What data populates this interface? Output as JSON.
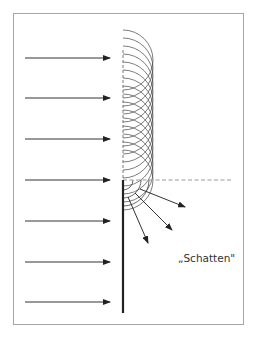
{
  "diagram": {
    "shadow_label": "„Schatten\"",
    "colors": {
      "frame": "#a6a6a6",
      "arrow": "#333333",
      "wall": "#222222",
      "wavelet": "#444444",
      "dashed": "#999999"
    },
    "incident_arrows_y": [
      58,
      98,
      139,
      180,
      221,
      262,
      302
    ],
    "incident_arrow_x_start": 25,
    "incident_arrow_x_end": 110,
    "wall": {
      "x": 123,
      "y_top": 180,
      "y_bottom": 313
    },
    "wavefront_line": {
      "x": 123,
      "y_top": 50,
      "y_bottom": 180
    },
    "shadow_boundary": {
      "y": 180,
      "x_start": 123,
      "x_end": 233
    },
    "wavelet_radius": 30,
    "wavelet_centers_y_start": 60,
    "wavelet_centers_y_end": 180,
    "wavelet_spacing": 8,
    "edge_arcs_radii": [
      10,
      18,
      26
    ],
    "diffracted_arrows": [
      {
        "from": [
          140,
          189
        ],
        "to": [
          185,
          207
        ]
      },
      {
        "from": [
          135,
          193
        ],
        "to": [
          172,
          230
        ]
      },
      {
        "from": [
          128,
          197
        ],
        "to": [
          148,
          243
        ]
      }
    ]
  }
}
